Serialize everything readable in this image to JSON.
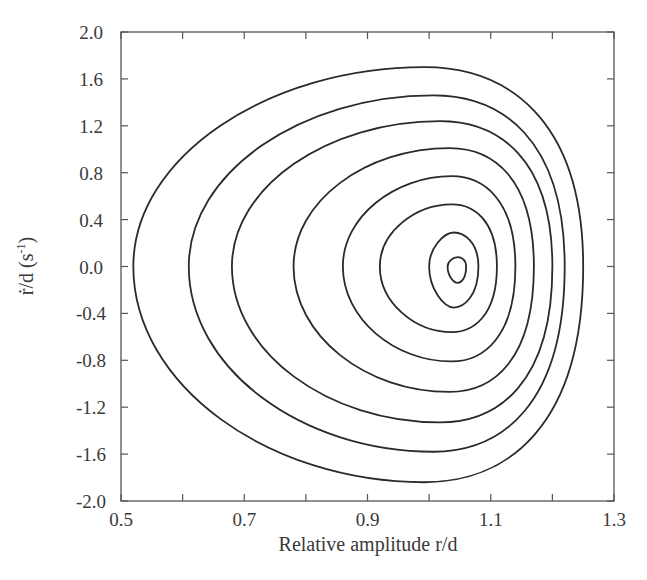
{
  "chart_data": {
    "type": "line",
    "subtype": "phase-portrait-closed-orbits",
    "title": "",
    "xlabel": "Relative amplitude r/d",
    "ylabel": "ṙ/d (s⁻¹)",
    "ylabel_parts": {
      "main": "ṙ/d (s",
      "sup": "-1",
      "close": ")"
    },
    "xlim": [
      0.5,
      1.3
    ],
    "ylim": [
      -2.0,
      2.0
    ],
    "xticks": [
      "0.5",
      "0.7",
      "0.9",
      "1.1",
      "1.3"
    ],
    "xticks_values": [
      0.5,
      0.7,
      0.9,
      1.1,
      1.3
    ],
    "x_minor_ticks": [
      0.6,
      0.8,
      1.0,
      1.2
    ],
    "yticks": [
      "2.0",
      "1.6",
      "1.2",
      "0.8",
      "0.4",
      "0.0",
      "-0.4",
      "-0.8",
      "-1.2",
      "-1.6",
      "-2.0"
    ],
    "yticks_values": [
      2.0,
      1.6,
      1.2,
      0.8,
      0.4,
      0.0,
      -0.4,
      -0.8,
      -1.2,
      -1.6,
      -2.0
    ],
    "grid": false,
    "legend": null,
    "line_color": "#2a2a2a",
    "series": [
      {
        "name": "orbit-1",
        "r_min": 0.52,
        "r_max": 1.25,
        "rdot_max": 1.7,
        "rdot_min": -1.84,
        "r_at_peak": 1.08
      },
      {
        "name": "orbit-2",
        "r_min": 0.61,
        "r_max": 1.22,
        "rdot_max": 1.46,
        "rdot_min": -1.58,
        "r_at_peak": 1.08
      },
      {
        "name": "orbit-3",
        "r_min": 0.68,
        "r_max": 1.2,
        "rdot_max": 1.24,
        "rdot_min": -1.33,
        "r_at_peak": 1.08
      },
      {
        "name": "orbit-4",
        "r_min": 0.78,
        "r_max": 1.17,
        "rdot_max": 1.01,
        "rdot_min": -1.07,
        "r_at_peak": 1.08
      },
      {
        "name": "orbit-5",
        "r_min": 0.86,
        "r_max": 1.14,
        "rdot_max": 0.77,
        "rdot_min": -0.81,
        "r_at_peak": 1.07
      },
      {
        "name": "orbit-6",
        "r_min": 0.92,
        "r_max": 1.11,
        "rdot_max": 0.53,
        "rdot_min": -0.56,
        "r_at_peak": 1.06
      },
      {
        "name": "orbit-7",
        "r_min": 1.0,
        "r_max": 1.08,
        "rdot_max": 0.29,
        "rdot_min": -0.35,
        "r_at_peak": 1.05
      },
      {
        "name": "orbit-8",
        "r_min": 1.03,
        "r_max": 1.06,
        "rdot_max": 0.08,
        "rdot_min": -0.14,
        "r_at_peak": 1.05
      }
    ],
    "center_point": {
      "r": 1.05,
      "rdot": -0.03
    }
  }
}
